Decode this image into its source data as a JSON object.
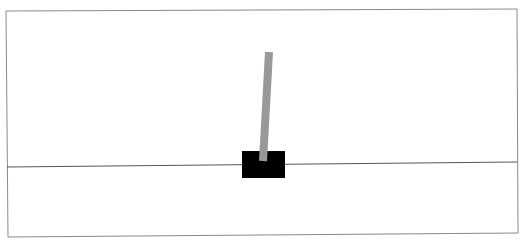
{
  "game": {
    "name": "CartPole",
    "colors": {
      "background": "#ffffff",
      "frame": "#8a8a8a",
      "track": "#555555",
      "cart": "#000000",
      "pole": "#999999"
    },
    "frame": {
      "top_left": [
        6,
        11
      ],
      "top_right": [
        517,
        9
      ],
      "bottom_right": [
        518,
        233
      ],
      "bottom_left": [
        8,
        237
      ]
    },
    "track": {
      "x1": 7,
      "y1": 167,
      "x2": 517,
      "y2": 162
    },
    "cart": {
      "x": 242,
      "y": 151,
      "width": 43,
      "height": 27
    },
    "pole": {
      "base": [
        263,
        161
      ],
      "top": [
        269,
        52
      ],
      "width": 8
    }
  }
}
